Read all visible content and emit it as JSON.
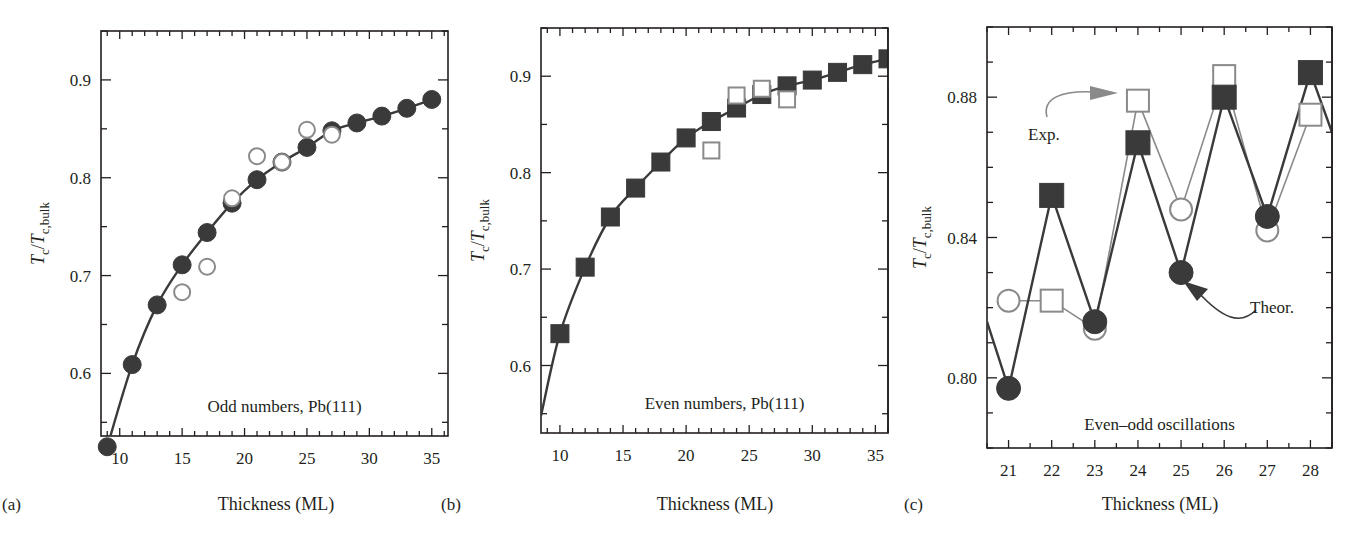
{
  "figure": {
    "panels": [
      {
        "id": "a",
        "letter": "(a)",
        "annotation": "Odd numbers, Pb(111)"
      },
      {
        "id": "b",
        "letter": "(b)",
        "annotation": "Even numbers, Pb(111)"
      },
      {
        "id": "c",
        "letter": "(c)",
        "annotation": "Even–odd oscillations",
        "arrow_labels": {
          "exp": "Exp.",
          "theor": "Theor."
        }
      }
    ],
    "xlabel": "Thickness (ML)",
    "ylabel_main": "T",
    "ylabel_sub1": "c",
    "ylabel_slash": "/",
    "ylabel_sub2": "c,bulk",
    "colors": {
      "filled_marker": "#3a3a3a",
      "open_marker_stroke": "#8a8a8a",
      "theory_line": "#3a3a3a",
      "exp_line": "#8a8a8a",
      "axis": "#231f20"
    }
  },
  "chart_data": [
    {
      "type": "line",
      "panel": "a",
      "title": "Odd numbers, Pb(111)",
      "xlabel": "Thickness (ML)",
      "ylabel": "Tc/Tc,bulk",
      "xlim": [
        8.5,
        36.3
      ],
      "ylim": [
        0.536,
        0.95
      ],
      "xticks": [
        10,
        15,
        20,
        25,
        30,
        35
      ],
      "yticks": [
        0.6,
        0.7,
        0.8,
        0.9
      ],
      "x_minor_step": 1,
      "y_minor_step": 0.05,
      "grid": false,
      "series": [
        {
          "name": "Theory",
          "marker": "filled-circle",
          "line": true,
          "x": [
            9,
            11,
            13,
            15,
            17,
            19,
            21,
            23,
            25,
            27,
            29,
            31,
            33,
            35
          ],
          "values": [
            0.525,
            0.609,
            0.67,
            0.711,
            0.744,
            0.774,
            0.798,
            0.816,
            0.831,
            0.848,
            0.856,
            0.863,
            0.871,
            0.88
          ]
        },
        {
          "name": "Experiment",
          "marker": "open-circle",
          "line": false,
          "x": [
            15,
            17,
            19,
            21,
            23,
            25,
            27
          ],
          "values": [
            0.683,
            0.709,
            0.779,
            0.822,
            0.816,
            0.849,
            0.844
          ]
        }
      ]
    },
    {
      "type": "line",
      "panel": "b",
      "title": "Even numbers, Pb(111)",
      "xlabel": "Thickness (ML)",
      "ylabel": "Tc/Tc,bulk",
      "xlim": [
        8.5,
        36.0
      ],
      "ylim": [
        0.53,
        0.95
      ],
      "xticks": [
        10,
        15,
        20,
        25,
        30,
        35
      ],
      "yticks": [
        0.6,
        0.7,
        0.8,
        0.9
      ],
      "x_minor_step": 1,
      "y_minor_step": 0.05,
      "grid": false,
      "series": [
        {
          "name": "Theory",
          "marker": "filled-square",
          "line": true,
          "line_start": [
            8.5,
            0.548
          ],
          "x": [
            10,
            12,
            14,
            16,
            18,
            20,
            22,
            24,
            26,
            28,
            30,
            32,
            34,
            36
          ],
          "values": [
            0.633,
            0.702,
            0.754,
            0.784,
            0.811,
            0.836,
            0.853,
            0.867,
            0.881,
            0.89,
            0.896,
            0.904,
            0.912,
            0.918
          ]
        },
        {
          "name": "Experiment",
          "marker": "open-square",
          "line": false,
          "x": [
            22,
            24,
            26,
            28
          ],
          "values": [
            0.823,
            0.88,
            0.887,
            0.876
          ]
        }
      ]
    },
    {
      "type": "line",
      "panel": "c",
      "title": "Even–odd oscillations",
      "xlabel": "Thickness (ML)",
      "ylabel": "Tc/Tc,bulk",
      "xlim": [
        20.5,
        28.5
      ],
      "ylim": [
        0.78,
        0.9
      ],
      "xticks": [
        21,
        22,
        23,
        24,
        25,
        26,
        27,
        28
      ],
      "yticks": [
        0.8,
        0.84,
        0.88
      ],
      "y_tick_labels": [
        "0.80",
        "0.84",
        "0.88"
      ],
      "x_minor_step": 0.5,
      "y_minor_step": 0.01,
      "grid": false,
      "series": [
        {
          "name": "Theor.",
          "marker": "filled-alternating",
          "markers_by_point": [
            "circle",
            "square",
            "circle",
            "square",
            "circle",
            "square",
            "circle",
            "square"
          ],
          "line": true,
          "line_start": [
            20.5,
            0.816
          ],
          "line_end": [
            28.5,
            0.87
          ],
          "x": [
            21,
            22,
            23,
            24,
            25,
            26,
            27,
            28
          ],
          "values": [
            0.797,
            0.852,
            0.816,
            0.867,
            0.83,
            0.88,
            0.846,
            0.887
          ]
        },
        {
          "name": "Exp.",
          "marker": "open-alternating",
          "markers_by_point": [
            "circle",
            "square",
            "circle",
            "square",
            "circle",
            "square",
            "circle",
            "square"
          ],
          "line": true,
          "x": [
            21,
            22,
            23,
            24,
            25,
            26,
            27,
            28
          ],
          "values": [
            0.822,
            0.822,
            0.814,
            0.879,
            0.848,
            0.886,
            0.842,
            0.875
          ]
        }
      ]
    }
  ]
}
